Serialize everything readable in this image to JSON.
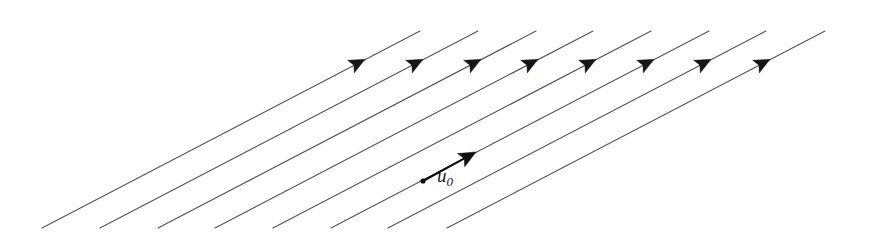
{
  "figure": {
    "type": "vector-field-diagram",
    "width": 871,
    "height": 249,
    "background_color": "#ffffff",
    "line_color": "#55555a",
    "arrow_color": "#18141a",
    "vector_color": "#100d12"
  },
  "field": {
    "line_count": 8,
    "arrowhead_count": 8,
    "direction_degrees": -23,
    "horizontal_spacing_px": 58,
    "description": "Eight equally spaced parallel straight lines sloping up to the right, each carrying a single filled triangular arrowhead pointing up-right",
    "lines": [
      {
        "x1": 42,
        "y1": 228,
        "x2": 420,
        "y2": 31,
        "arrow_x": 358,
        "arrow_y": 63
      },
      {
        "x1": 100,
        "y1": 228,
        "x2": 478,
        "y2": 31,
        "arrow_x": 416,
        "arrow_y": 63
      },
      {
        "x1": 158,
        "y1": 228,
        "x2": 536,
        "y2": 31,
        "arrow_x": 474,
        "arrow_y": 63
      },
      {
        "x1": 215,
        "y1": 228,
        "x2": 593,
        "y2": 31,
        "arrow_x": 531,
        "arrow_y": 63
      },
      {
        "x1": 273,
        "y1": 228,
        "x2": 651,
        "y2": 31,
        "arrow_x": 589,
        "arrow_y": 63
      },
      {
        "x1": 331,
        "y1": 228,
        "x2": 709,
        "y2": 31,
        "arrow_x": 647,
        "arrow_y": 63
      },
      {
        "x1": 388,
        "y1": 228,
        "x2": 766,
        "y2": 31,
        "arrow_x": 704,
        "arrow_y": 63
      },
      {
        "x1": 447,
        "y1": 228,
        "x2": 825,
        "y2": 31,
        "arrow_x": 763,
        "arrow_y": 63
      }
    ]
  },
  "vector": {
    "label_text": "u",
    "label_subscript": "0",
    "base_x": 423,
    "base_y": 181,
    "tip_x": 476,
    "tip_y": 152,
    "label_x": 437,
    "label_y": 166,
    "base_dot_radius": 2.6
  }
}
